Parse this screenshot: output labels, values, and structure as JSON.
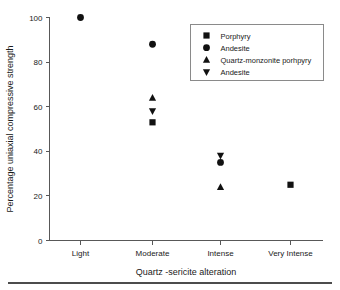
{
  "chart_data": {
    "type": "scatter",
    "title": "",
    "xlabel": "Quartz -sericite alteration",
    "ylabel": "Percentage uniaxial compressive strength",
    "categories": [
      "Light",
      "Moderate",
      "Intense",
      "Very Intense"
    ],
    "ylim": [
      0,
      100
    ],
    "yticks": [
      0,
      20,
      40,
      60,
      80,
      100
    ],
    "ytick_labels": [
      "0",
      "20",
      "40",
      "60",
      "80",
      "100"
    ],
    "grid": false,
    "legend_position": "top-right",
    "series": [
      {
        "name": "Porphyry",
        "marker": "square",
        "color": "#111111",
        "points": [
          {
            "x": "Moderate",
            "y": 53
          },
          {
            "x": "Very Intense",
            "y": 25
          }
        ]
      },
      {
        "name": "Andesite",
        "marker": "circle",
        "color": "#111111",
        "points": [
          {
            "x": "Light",
            "y": 100
          },
          {
            "x": "Moderate",
            "y": 88
          },
          {
            "x": "Intense",
            "y": 35
          }
        ]
      },
      {
        "name": "Quartz-monzonite porhpyry",
        "marker": "triangle-up",
        "color": "#111111",
        "points": [
          {
            "x": "Moderate",
            "y": 64
          },
          {
            "x": "Intense",
            "y": 24
          }
        ]
      },
      {
        "name": "Andesite",
        "marker": "triangle-down",
        "color": "#111111",
        "points": [
          {
            "x": "Moderate",
            "y": 58
          },
          {
            "x": "Intense",
            "y": 38
          }
        ]
      }
    ]
  }
}
